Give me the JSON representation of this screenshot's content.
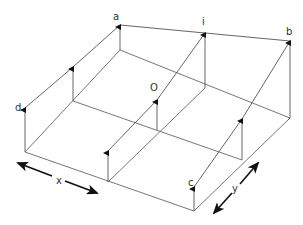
{
  "diagram": {
    "title": "",
    "colors": {
      "line": "#555555",
      "arrow": "#111111",
      "background": "#ffffff"
    },
    "base_grid": [
      [
        [
          120,
          50
        ],
        [
          205,
          88
        ],
        [
          290,
          118
        ]
      ],
      [
        [
          73,
          101
        ],
        [
          157,
          130
        ],
        [
          242,
          160
        ]
      ],
      [
        [
          25,
          152
        ],
        [
          108,
          182
        ],
        [
          194,
          211
        ]
      ]
    ],
    "top_points": [
      [
        [
          120,
          25
        ],
        [
          205,
          33
        ],
        [
          290,
          41
        ]
      ],
      [
        [
          73,
          67
        ],
        [
          157,
          100
        ],
        [
          242,
          119
        ]
      ],
      [
        [
          25,
          108
        ],
        [
          108,
          151
        ],
        [
          194,
          187
        ]
      ]
    ],
    "labels": {
      "a": "a",
      "i": "i",
      "b": "b",
      "d": "d",
      "O": "O",
      "c": "c",
      "x": "x",
      "y": "y"
    }
  }
}
